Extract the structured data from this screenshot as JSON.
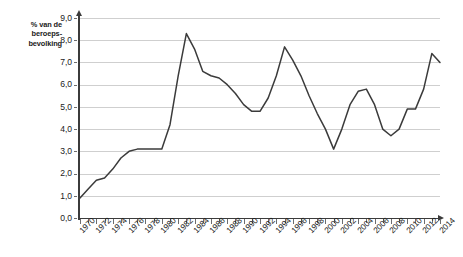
{
  "axis": {
    "y_label": [
      "% van de",
      "beroeps-",
      "bevolking"
    ],
    "y_ticks": [
      "9,0",
      "8,0",
      "7,0",
      "6,0",
      "5,0",
      "4,0",
      "3,0",
      "2,0",
      "1,0",
      "0,0"
    ],
    "x_ticks": [
      "1970",
      "1972",
      "1974",
      "1976",
      "1978",
      "1980",
      "1982",
      "1984",
      "1986",
      "1988",
      "1990",
      "1992",
      "1994",
      "1996",
      "1998",
      "2000",
      "2002",
      "2004",
      "2006",
      "2008",
      "2010",
      "2012",
      "2014"
    ]
  },
  "colors": {
    "series": "#3b3b3b",
    "grid": "#cfcfcf",
    "axis": "#3b3b3b",
    "text": "#1b1b1b",
    "background": "#ffffff"
  },
  "chart_data": {
    "type": "line",
    "title": "",
    "subtitle": "",
    "xlabel": "",
    "ylabel": "% van de beroepsbevolking",
    "xlim": [
      1970,
      2014
    ],
    "ylim": [
      0.0,
      9.0
    ],
    "ytick_step": 1.0,
    "xtick_step": 1,
    "xtick_label_step": 2,
    "grid": true,
    "legend": false,
    "legend_position": "none",
    "series": [
      {
        "name": "% van de beroepsbevolking",
        "color": "#3b3b3b",
        "x": [
          1970,
          1971,
          1972,
          1973,
          1974,
          1975,
          1976,
          1977,
          1978,
          1979,
          1980,
          1981,
          1982,
          1983,
          1984,
          1985,
          1986,
          1987,
          1988,
          1989,
          1990,
          1991,
          1992,
          1993,
          1994,
          1995,
          1996,
          1997,
          1998,
          1999,
          2000,
          2001,
          2002,
          2003,
          2004,
          2005,
          2006,
          2007,
          2008,
          2009,
          2010,
          2011,
          2012,
          2013,
          2014
        ],
        "values": [
          0.9,
          1.3,
          1.7,
          1.8,
          2.2,
          2.7,
          3.0,
          3.1,
          3.1,
          3.1,
          3.1,
          4.2,
          6.4,
          8.3,
          7.6,
          6.6,
          6.4,
          6.3,
          6.0,
          5.6,
          5.1,
          4.8,
          4.8,
          5.4,
          6.4,
          7.7,
          7.1,
          6.4,
          5.5,
          4.7,
          4.0,
          3.1,
          4.0,
          5.1,
          5.7,
          5.8,
          5.1,
          4.0,
          3.7,
          4.0,
          4.9,
          4.9,
          5.8,
          7.4,
          7.0
        ]
      }
    ]
  }
}
